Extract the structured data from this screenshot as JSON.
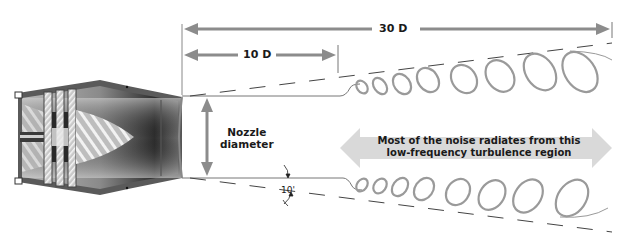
{
  "dimensions": {
    "total_length_label": "30 D",
    "mixing_region_label": "10 D",
    "nozzle_label_line1": "Nozzle",
    "nozzle_label_line2": "diameter",
    "spread_angle_label": "10'"
  },
  "annotations": {
    "noise_region_line1": "Most of the noise radiates from this",
    "noise_region_line2": "low-frequency turbulence region"
  },
  "colors": {
    "arrow_gray": "#8c8c8c",
    "wide_arrow": "#d9d9d9",
    "engine_dark": "#4a4a4a",
    "engine_mid": "#8a8a8a",
    "vortex": "#9a9a9a",
    "line": "#555555"
  }
}
